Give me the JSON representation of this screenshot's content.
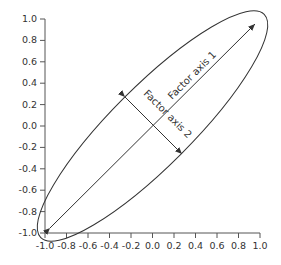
{
  "diagram": {
    "type": "factor-ellipse",
    "axis_labels": {
      "factor1": "Factor axis 1",
      "factor2": "Factor axis 2"
    },
    "y_ticks": [
      "1.0",
      "0.8",
      "0.6",
      "0.4",
      "0.2",
      "0.0",
      "-0.2",
      "-0.4",
      "-0.6",
      "-0.8",
      "-1.0"
    ],
    "x_ticks": [
      "-1.0",
      "-0.8",
      "-0.6",
      "-0.4",
      "-0.2",
      "0.0",
      "0.2",
      "0.4",
      "0.6",
      "0.8",
      "1.0"
    ],
    "colors": {
      "line": "#333333",
      "text": "#333333",
      "background": "#ffffff"
    }
  }
}
